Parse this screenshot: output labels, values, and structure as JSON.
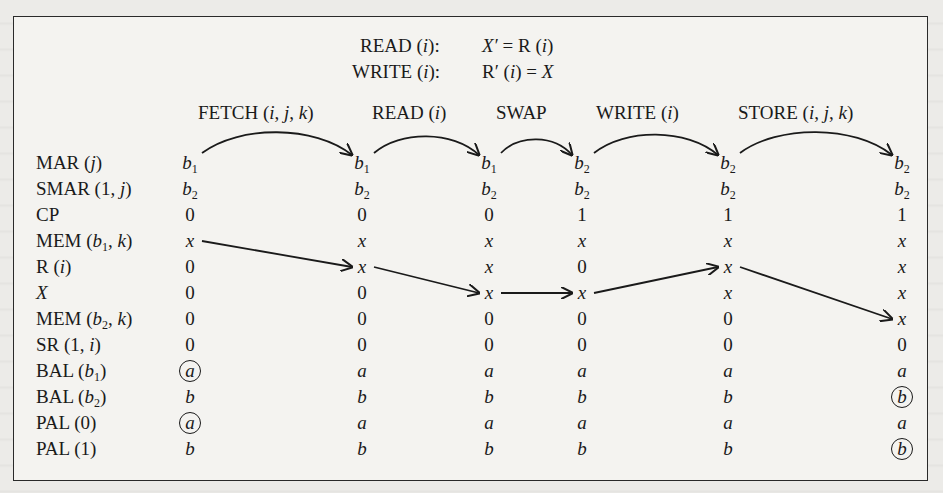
{
  "definitions": [
    {
      "op": "READ (i):",
      "eq": "X′ = R (i)"
    },
    {
      "op": "WRITE (i):",
      "eq": "R′ (i) = X"
    }
  ],
  "steps": [
    "FETCH (i, j, k)",
    "READ (i)",
    "SWAP",
    "WRITE (i)",
    "STORE (i, j, k)"
  ],
  "rows": [
    {
      "label": "MAR (j)",
      "values": [
        "b1",
        "b1",
        "b1",
        "b2",
        "b2",
        "b2"
      ]
    },
    {
      "label": "SMAR (1, j)",
      "values": [
        "b2",
        "b2",
        "b2",
        "b2",
        "b2",
        "b2"
      ]
    },
    {
      "label": "CP",
      "values": [
        "0",
        "0",
        "0",
        "1",
        "1",
        "1"
      ]
    },
    {
      "label": "MEM (b1, k)",
      "values": [
        "x",
        "x",
        "x",
        "x",
        "x",
        "x"
      ]
    },
    {
      "label": "R (i)",
      "values": [
        "0",
        "x",
        "x",
        "0",
        "x",
        "x"
      ]
    },
    {
      "label": "X",
      "values": [
        "0",
        "0",
        "x",
        "x",
        "x",
        "x"
      ]
    },
    {
      "label": "MEM (b2, k)",
      "values": [
        "0",
        "0",
        "0",
        "0",
        "0",
        "x"
      ]
    },
    {
      "label": "SR (1, i)",
      "values": [
        "0",
        "0",
        "0",
        "0",
        "0",
        "0"
      ]
    },
    {
      "label": "BAL (b1)",
      "values": [
        "a",
        "a",
        "a",
        "a",
        "a",
        "a"
      ]
    },
    {
      "label": "BAL (b2)",
      "values": [
        "b",
        "b",
        "b",
        "b",
        "b",
        "b"
      ]
    },
    {
      "label": "PAL (0)",
      "values": [
        "a",
        "a",
        "a",
        "a",
        "a",
        "a"
      ]
    },
    {
      "label": "PAL (1)",
      "values": [
        "b",
        "b",
        "b",
        "b",
        "b",
        "b"
      ]
    }
  ],
  "circled": [
    {
      "row": 8,
      "col": 0
    },
    {
      "row": 10,
      "col": 0
    },
    {
      "row": 9,
      "col": 5
    },
    {
      "row": 11,
      "col": 5
    }
  ],
  "arrows": [
    {
      "type": "arc",
      "from": {
        "row": 0,
        "col": 0
      },
      "to": {
        "row": 0,
        "col": 1
      }
    },
    {
      "type": "arc",
      "from": {
        "row": 0,
        "col": 1
      },
      "to": {
        "row": 0,
        "col": 2
      }
    },
    {
      "type": "arc",
      "from": {
        "row": 0,
        "col": 2
      },
      "to": {
        "row": 0,
        "col": 3
      }
    },
    {
      "type": "arc",
      "from": {
        "row": 0,
        "col": 3
      },
      "to": {
        "row": 0,
        "col": 4
      }
    },
    {
      "type": "arc",
      "from": {
        "row": 0,
        "col": 4
      },
      "to": {
        "row": 0,
        "col": 5
      }
    },
    {
      "type": "line",
      "from": {
        "row": 3,
        "col": 0
      },
      "to": {
        "row": 4,
        "col": 1
      }
    },
    {
      "type": "line",
      "from": {
        "row": 4,
        "col": 1
      },
      "to": {
        "row": 5,
        "col": 2
      }
    },
    {
      "type": "line",
      "from": {
        "row": 5,
        "col": 2
      },
      "to": {
        "row": 5,
        "col": 3
      }
    },
    {
      "type": "line",
      "from": {
        "row": 5,
        "col": 3
      },
      "to": {
        "row": 4,
        "col": 4
      }
    },
    {
      "type": "line",
      "from": {
        "row": 4,
        "col": 4
      },
      "to": {
        "row": 6,
        "col": 5
      }
    }
  ]
}
